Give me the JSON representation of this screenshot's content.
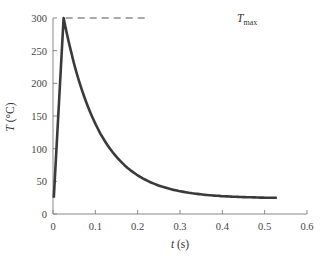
{
  "chart_data": {
    "type": "line",
    "title": "",
    "xlabel": "t (s)",
    "ylabel": "T (°C)",
    "xlim": [
      0,
      0.6
    ],
    "ylim": [
      0,
      300
    ],
    "xticks": [
      "0",
      "0.1",
      "0.2",
      "0.3",
      "0.4",
      "0.5",
      "0.6"
    ],
    "yticks": [
      "0",
      "50",
      "100",
      "150",
      "200",
      "250",
      "300"
    ],
    "grid": false,
    "legend": null,
    "annotations": [
      {
        "text": "T_max",
        "type": "dashed-reference-line",
        "y": 300,
        "x_from": 0.03,
        "x_to": 0.22
      }
    ],
    "series": [
      {
        "name": "temperature",
        "color": "#3a3a3a",
        "x": [
          0.002,
          0.025,
          0.05,
          0.075,
          0.1,
          0.125,
          0.15,
          0.175,
          0.2,
          0.25,
          0.3,
          0.35,
          0.4,
          0.45,
          0.5,
          0.53
        ],
        "y": [
          25,
          300,
          236,
          188,
          151,
          123,
          102,
          85,
          73,
          55,
          43,
          36,
          31,
          28,
          26,
          25
        ]
      }
    ]
  },
  "labels": {
    "xlabel_italic": "t",
    "xlabel_unit": " (s)",
    "ylabel_italic": "T",
    "ylabel_unit": " (°C)",
    "tmax_main": "T",
    "tmax_sub": "max"
  }
}
